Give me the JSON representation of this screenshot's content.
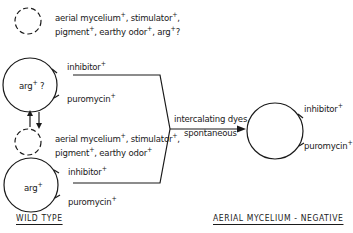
{
  "diagram": {
    "top_plasmid": {
      "line1": [
        "aerial mycelium",
        "+",
        ", stimulator",
        "+",
        ","
      ],
      "line2": [
        "pigment",
        "+",
        ", earthy odor",
        "+",
        ", arg",
        "+",
        "?"
      ]
    },
    "upper_chromosome": {
      "center": [
        "arg",
        "+",
        " ?"
      ],
      "inhibitor": [
        "inhibitor",
        "+"
      ],
      "puromycin": [
        "puromycin",
        "+"
      ]
    },
    "exchange_arrows": "↑↓",
    "lower_plasmid": {
      "line1": [
        "aerial mycelium",
        "+",
        ", stimulator",
        "+",
        ","
      ],
      "line2": [
        "pigment",
        "+",
        ", earthy odor",
        "+"
      ]
    },
    "lower_chromosome": {
      "center": [
        "arg",
        "+"
      ],
      "inhibitor": [
        "inhibitor",
        "+"
      ],
      "puromycin": [
        "puromycin",
        "+"
      ]
    },
    "transition": {
      "line1": "intercalating dyes,",
      "line2": "spontaneous"
    },
    "result_chromosome": {
      "inhibitor": [
        "inhibitor",
        "+"
      ],
      "puromycin": [
        "puromycin",
        "+"
      ]
    },
    "captions": {
      "left": "WILD TYPE",
      "right": "AERIAL MYCELIUM - NEGATIVE"
    }
  }
}
